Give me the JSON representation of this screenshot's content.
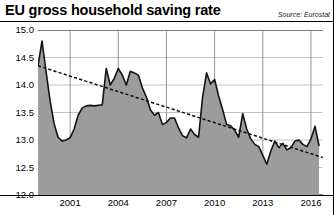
{
  "header": {
    "title": "EU gross household saving rate",
    "source": "Source: Eurostat"
  },
  "chart_data": {
    "type": "line",
    "title": "EU gross household saving rate",
    "subtitle": "",
    "source": "Source: Eurostat",
    "xlabel": "",
    "ylabel": "",
    "grid": true,
    "legend": false,
    "legend_position": "none",
    "fill": "area-under-line",
    "xlim": [
      1999.0,
      2016.75
    ],
    "ylim": [
      12.0,
      15.0
    ],
    "yticks": [
      "15.0",
      "14.5",
      "14.0",
      "13.5",
      "13.0",
      "12.5",
      "12.0"
    ],
    "ytick_values": [
      15.0,
      14.5,
      14.0,
      13.5,
      13.0,
      12.5,
      12.0
    ],
    "xticks": [
      "2001",
      "2004",
      "2007",
      "2010",
      "2013",
      "2016"
    ],
    "xtick_values": [
      2001,
      2004,
      2007,
      2010,
      2013,
      2016
    ],
    "series": [
      {
        "name": "EU gross household saving rate",
        "kind": "line-area",
        "color": "#1a1a1a",
        "fill_color": "#9c9c9c",
        "x": [
          1999.0,
          1999.25,
          1999.5,
          1999.75,
          2000.0,
          2000.25,
          2000.5,
          2000.75,
          2001.0,
          2001.25,
          2001.5,
          2001.75,
          2002.0,
          2002.25,
          2002.5,
          2002.75,
          2003.0,
          2003.25,
          2003.5,
          2003.75,
          2004.0,
          2004.25,
          2004.5,
          2004.75,
          2005.0,
          2005.25,
          2005.5,
          2005.75,
          2006.0,
          2006.25,
          2006.5,
          2006.75,
          2007.0,
          2007.25,
          2007.5,
          2007.75,
          2008.0,
          2008.25,
          2008.5,
          2008.75,
          2009.0,
          2009.25,
          2009.5,
          2009.75,
          2010.0,
          2010.25,
          2010.5,
          2010.75,
          2011.0,
          2011.25,
          2011.5,
          2011.75,
          2012.0,
          2012.25,
          2012.5,
          2012.75,
          2013.0,
          2013.25,
          2013.5,
          2013.75,
          2014.0,
          2014.25,
          2014.5,
          2014.75,
          2015.0,
          2015.25,
          2015.5,
          2015.75,
          2016.0,
          2016.25,
          2016.5
        ],
        "y": [
          14.35,
          14.8,
          14.25,
          13.72,
          13.3,
          13.05,
          12.98,
          13.0,
          13.04,
          13.2,
          13.45,
          13.58,
          13.62,
          13.63,
          13.62,
          13.63,
          13.64,
          14.3,
          14.0,
          14.12,
          14.3,
          14.18,
          14.0,
          14.25,
          14.22,
          14.18,
          13.95,
          13.78,
          13.55,
          13.45,
          13.5,
          13.28,
          13.32,
          13.4,
          13.4,
          13.22,
          13.08,
          13.04,
          13.2,
          13.1,
          13.05,
          13.78,
          14.22,
          14.02,
          14.1,
          13.8,
          13.55,
          13.28,
          13.26,
          13.18,
          13.05,
          13.48,
          13.2,
          13.02,
          12.92,
          12.88,
          12.72,
          12.56,
          12.8,
          12.98,
          12.86,
          12.94,
          12.82,
          12.86,
          12.98,
          13.0,
          12.92,
          12.88,
          13.02,
          13.25,
          12.9
        ]
      },
      {
        "name": "linear trend",
        "kind": "dashed-trend",
        "color": "#111111",
        "style": "dashed",
        "x": [
          1999.0,
          2016.75
        ],
        "y": [
          14.35,
          12.68
        ]
      }
    ]
  },
  "axes": {
    "y_labels": [
      "15.0",
      "14.5",
      "14.0",
      "13.5",
      "13.0",
      "12.5",
      "12.0"
    ],
    "x_labels": [
      "2001",
      "2004",
      "2007",
      "2010",
      "2013",
      "2016"
    ]
  }
}
